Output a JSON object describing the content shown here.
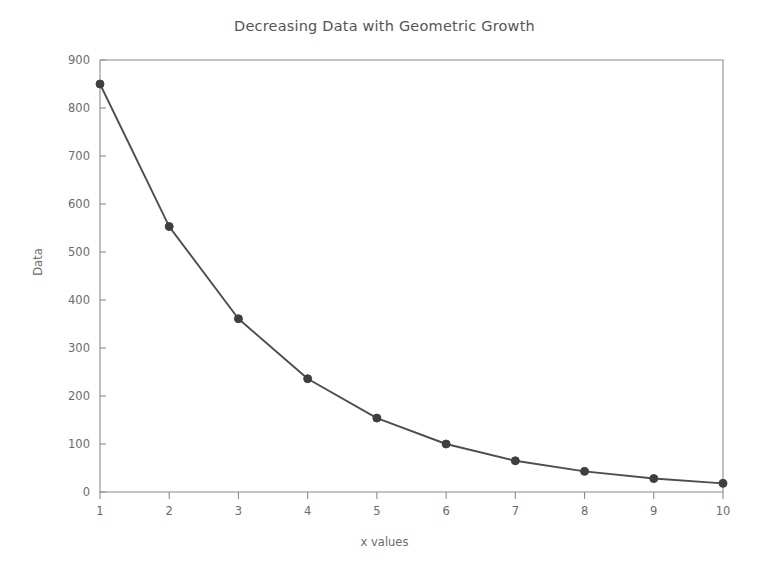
{
  "chart_data": {
    "type": "line",
    "title": "Decreasing Data with Geometric Growth",
    "xlabel": "x values",
    "ylabel": "Data",
    "x": [
      1,
      2,
      3,
      4,
      5,
      6,
      7,
      8,
      9,
      10
    ],
    "values": [
      850,
      553,
      361,
      236,
      154,
      100,
      65,
      43,
      28,
      18
    ],
    "series": [
      {
        "name": "Data",
        "values": [
          850,
          553,
          361,
          236,
          154,
          100,
          65,
          43,
          28,
          18
        ]
      }
    ],
    "xlim": [
      1,
      10
    ],
    "ylim": [
      0,
      900
    ],
    "xticks": [
      1,
      2,
      3,
      4,
      5,
      6,
      7,
      8,
      9,
      10
    ],
    "yticks": [
      0,
      100,
      200,
      300,
      400,
      500,
      600,
      700,
      800,
      900
    ],
    "xtick_labels": [
      "1",
      "2",
      "3",
      "4",
      "5",
      "6",
      "7",
      "8",
      "9",
      "10"
    ],
    "ytick_labels": [
      "0",
      "100",
      "200",
      "300",
      "400",
      "500",
      "600",
      "700",
      "800",
      "900"
    ],
    "grid": false,
    "legend": false,
    "marker": "circle",
    "line_color": "#4e4e4e",
    "marker_color": "#3f3f3f",
    "axis_color": "#8c8c8c",
    "text_color": "#6b6b6b",
    "title_color": "#555555",
    "background_color": "#ffffff"
  }
}
